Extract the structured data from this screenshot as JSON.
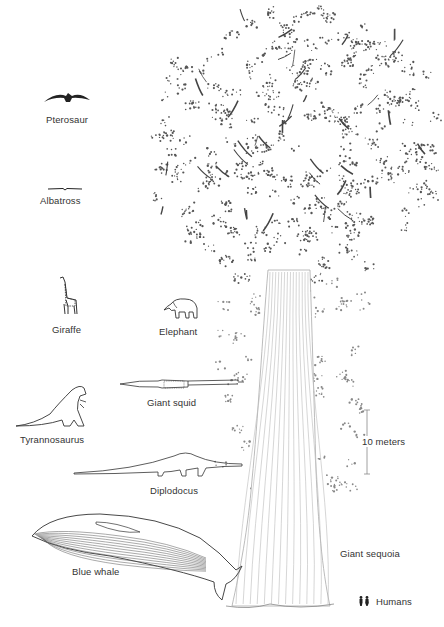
{
  "figure": {
    "scale_bar": {
      "label": "10 meters",
      "length_m": 10
    },
    "organisms": [
      {
        "id": "pterosaur",
        "label": "Pterosaur"
      },
      {
        "id": "albatross",
        "label": "Albatross"
      },
      {
        "id": "giraffe",
        "label": "Giraffe"
      },
      {
        "id": "elephant",
        "label": "Elephant"
      },
      {
        "id": "giant-squid",
        "label": "Giant squid"
      },
      {
        "id": "tyrannosaurus",
        "label": "Tyrannosaurus"
      },
      {
        "id": "diplodocus",
        "label": "Diplodocus"
      },
      {
        "id": "blue-whale",
        "label": "Blue whale"
      },
      {
        "id": "giant-sequoia",
        "label": "Giant sequoia"
      },
      {
        "id": "humans",
        "label": "Humans"
      }
    ],
    "colors": {
      "ink": "#333333",
      "foliage": "#555555",
      "background": "#ffffff"
    }
  }
}
